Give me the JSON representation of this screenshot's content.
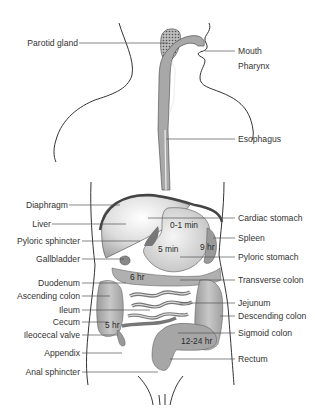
{
  "diagram": {
    "labels_left": [
      {
        "id": "parotid-gland",
        "text": "Parotid gland",
        "y": 43
      },
      {
        "id": "diaphragm",
        "text": "Diaphragm",
        "y": 205
      },
      {
        "id": "liver",
        "text": "Liver",
        "y": 224
      },
      {
        "id": "pyloric-sphincter",
        "text": "Pyloric sphincter",
        "y": 241
      },
      {
        "id": "gallbladder",
        "text": "Gallbladder",
        "y": 259
      },
      {
        "id": "duodenum",
        "text": "Duodenum",
        "y": 283
      },
      {
        "id": "ascending-colon",
        "text": "Ascending colon",
        "y": 296
      },
      {
        "id": "ileum",
        "text": "Ileum",
        "y": 310
      },
      {
        "id": "cecum",
        "text": "Cecum",
        "y": 322
      },
      {
        "id": "ileocecal-valve",
        "text": "Ileocecal valve",
        "y": 335
      },
      {
        "id": "appendix",
        "text": "Appendix",
        "y": 353
      },
      {
        "id": "anal-sphincter",
        "text": "Anal sphincter",
        "y": 372
      }
    ],
    "labels_right": [
      {
        "id": "mouth",
        "text": "Mouth",
        "y": 51
      },
      {
        "id": "pharynx",
        "text": "Pharynx",
        "y": 66
      },
      {
        "id": "esophagus",
        "text": "Esophagus",
        "y": 139
      },
      {
        "id": "cardiac-stomach",
        "text": "Cardiac stomach",
        "y": 218
      },
      {
        "id": "spleen",
        "text": "Spleen",
        "y": 238
      },
      {
        "id": "pyloric-stomach",
        "text": "Pyloric stomach",
        "y": 257
      },
      {
        "id": "transverse-colon",
        "text": "Transverse colon",
        "y": 280
      },
      {
        "id": "jejunum",
        "text": "Jejunum",
        "y": 303
      },
      {
        "id": "descending-colon",
        "text": "Descending colon",
        "y": 316
      },
      {
        "id": "sigmoid-colon",
        "text": "Sigmoid colon",
        "y": 333
      },
      {
        "id": "rectum",
        "text": "Rectum",
        "y": 359
      }
    ],
    "times": [
      {
        "id": "time-cardiac",
        "text": "0-1 min",
        "x": 170,
        "y": 224
      },
      {
        "id": "time-stomach",
        "text": "5 min",
        "x": 160,
        "y": 247
      },
      {
        "id": "time-pyloric",
        "text": "9 hr",
        "x": 201,
        "y": 244
      },
      {
        "id": "time-duodenum",
        "text": "6 hr",
        "x": 131,
        "y": 274
      },
      {
        "id": "time-cecum",
        "text": "5 hr",
        "x": 106,
        "y": 320
      },
      {
        "id": "time-sigmoid",
        "text": "12-24 hr",
        "x": 181,
        "y": 337
      }
    ],
    "colors": {
      "outline": "#333333",
      "organ_light": "#e2e2e2",
      "organ_mid": "#b5b5b5",
      "organ_dark": "#8a8a8a",
      "leader_line": "#555555",
      "text": "#333333"
    }
  }
}
